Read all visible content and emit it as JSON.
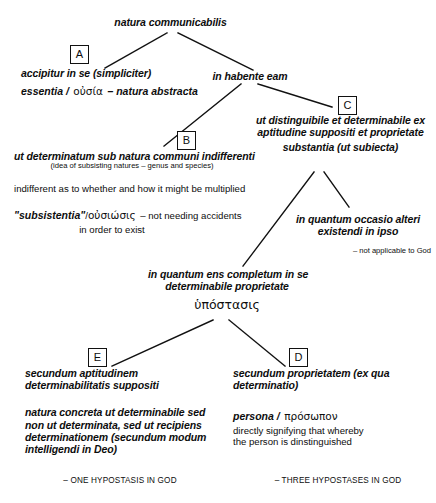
{
  "diagram": {
    "title": "natura communicabilis",
    "root": {
      "label": "natura communicabilis"
    },
    "box_labels": {
      "a": "A",
      "b": "B",
      "c": "C",
      "d": "D",
      "e": "E"
    },
    "branch_a": {
      "line1": "accipitur in se (simpliciter)",
      "line2_latin": "essentia /",
      "line2_greek": "οὐσία",
      "line2_tail": "– natura abstracta"
    },
    "branch_right": {
      "label": "in habente eam"
    },
    "branch_b": {
      "line1": "ut determinatum sub natura communi indifferenti",
      "line2": "(idea of subsisting natures – genus and species)",
      "line3": "indifferent as to whether and how it might be multiplied",
      "line4_quoted": "\"subsistentia\"",
      "line4_sep": "/",
      "line4_greek": "οὐσιώσις",
      "line4_tail": "– not needing accidents",
      "line5": "in order to exist"
    },
    "branch_c": {
      "line1": "ut distinguibile et determinabile ex",
      "line2": "aptitudine suppositi et proprietate",
      "line3": "substantia (ut subiecta)"
    },
    "branch_occasio": {
      "line1": "in quantum occasio alteri",
      "line2": "existendi in ipso",
      "note": "– not applicable to God"
    },
    "branch_completum": {
      "line1": "in quantum ens completum in se",
      "line2": "determinabile proprietate",
      "greek": "ὑπόστασις"
    },
    "branch_e": {
      "line1": "secundum aptitudinem",
      "line2": "determinabilitatis suppositi",
      "line3": "natura concreta ut determinabile sed",
      "line4": "non ut determinata, sed ut recipiens",
      "line5": "determinationem (secundum modum",
      "line6": "intelligendi in Deo)",
      "conclusion": "– ONE HYPOSTASIS IN GOD"
    },
    "branch_d": {
      "line1": "secundum proprietatem (ex qua",
      "line2": "determinatio)",
      "line3_latin": "persona /",
      "line3_greek": "πρόσωπον",
      "line4": "directly signifying that whereby",
      "line5": "the person is dinstinguished",
      "conclusion": "– THREE HYPOSTASES IN GOD"
    },
    "colors": {
      "ink": "#0d0d0d",
      "background": "#ffffff",
      "line": "#111111"
    }
  }
}
